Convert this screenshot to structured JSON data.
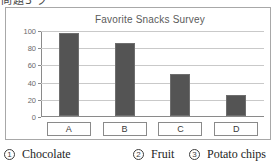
{
  "figure": {
    "top_fragment": "問題3 グラフ",
    "frame_border_color": "#a8a8a8"
  },
  "chart_data": {
    "type": "bar",
    "title": "Favorite Snacks Survey",
    "xlabel": "",
    "ylabel": "",
    "categories": [
      "A",
      "B",
      "C",
      "D"
    ],
    "values": [
      97,
      85,
      49,
      25
    ],
    "ylim": [
      0,
      100
    ],
    "yticks": [
      "0",
      "20",
      "40",
      "60",
      "80",
      "100"
    ],
    "ytick_values": [
      0,
      20,
      40,
      60,
      80,
      100
    ],
    "grid": true,
    "legend_position": "below-figure",
    "bar_color": "#545454",
    "bar_edge_color": "#6e6e6e",
    "gridline_color": "#c9c9c9",
    "axis_color": "#8a8a8a",
    "title_color": "#5b5b5b",
    "tick_label_color": "#6a6a6a"
  },
  "legend": {
    "items": [
      {
        "num": "①",
        "label": "Chocolate"
      },
      {
        "num": "②",
        "label": "Fruit"
      },
      {
        "num": "③",
        "label": "Potato chips"
      }
    ]
  }
}
